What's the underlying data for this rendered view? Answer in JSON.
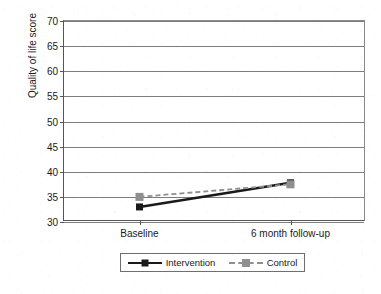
{
  "chart_data": {
    "type": "line",
    "title": "",
    "xlabel": "",
    "ylabel": "Quality of life score",
    "categories": [
      "Baseline",
      "6 month follow-up"
    ],
    "ylim": [
      30,
      70
    ],
    "yticks": [
      30,
      35,
      40,
      45,
      50,
      55,
      60,
      65,
      70
    ],
    "ytick_labels": [
      "30",
      "35",
      "40",
      "45",
      "50",
      "55",
      "60",
      "65",
      "70"
    ],
    "grid": true,
    "legend_position": "bottom",
    "series": [
      {
        "name": "Intervention",
        "values": [
          33.0,
          37.8
        ],
        "color": "#1a1a1a",
        "linestyle": "solid",
        "marker": "square"
      },
      {
        "name": "Control",
        "values": [
          35.0,
          37.5
        ],
        "color": "#8f8f8f",
        "linestyle": "dashed",
        "marker": "square"
      }
    ]
  },
  "axis": {
    "y_title": "Quality of life score",
    "y_ticks": [
      "70",
      "65",
      "60",
      "55",
      "50",
      "45",
      "40",
      "35",
      "30"
    ],
    "x_ticks": [
      "Baseline",
      "6 month follow-up"
    ]
  },
  "legend": {
    "items": [
      {
        "label": "Intervention"
      },
      {
        "label": "Control"
      }
    ]
  },
  "colors": {
    "intervention": "#1a1a1a",
    "control": "#8f8f8f",
    "axis": "#555555",
    "grid": "#7d7d7d",
    "background": "#ffffff"
  }
}
